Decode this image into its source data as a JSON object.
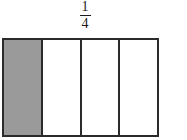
{
  "figure": {
    "title": "",
    "kind": "fraction-bar-model",
    "label": {
      "numerator": "1",
      "denominator": "4",
      "text": "1/4"
    },
    "model": {
      "total_parts": 4,
      "shaded_parts": 1,
      "cells": [
        {
          "index": 1,
          "shaded": true,
          "state": "shaded"
        },
        {
          "index": 2,
          "shaded": false,
          "state": "unshaded"
        },
        {
          "index": 3,
          "shaded": false,
          "state": "unshaded"
        },
        {
          "index": 4,
          "shaded": false,
          "state": "unshaded"
        }
      ]
    },
    "colors": {
      "background": "#ffffff",
      "shade_fill": "#9a9a9a",
      "unshaded_fill": "#ffffff",
      "stroke": "#2b2b2b",
      "text": "#1c1c1c"
    }
  },
  "chart_data": {
    "type": "bar",
    "title": "1/4",
    "xlabel": "",
    "ylabel": "",
    "categories": [
      "part-1",
      "part-2",
      "part-3",
      "part-4"
    ],
    "values": [
      1,
      0,
      0,
      0
    ],
    "value_meaning": "1 = shaded, 0 = unshaded",
    "fraction_shaded": 0.25,
    "legend": [],
    "grid": false
  }
}
